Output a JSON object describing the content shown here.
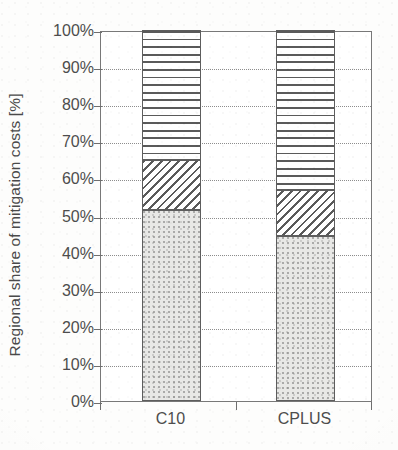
{
  "chart_data": {
    "type": "bar",
    "stacked": true,
    "title": "",
    "xlabel": "",
    "ylabel": "Regional share of mitigation costs [%]",
    "categories": [
      "C10",
      "CPLUS"
    ],
    "ylim": [
      0,
      100
    ],
    "yticks": [
      "0%",
      "10%",
      "20%",
      "30%",
      "40%",
      "50%",
      "60%",
      "70%",
      "80%",
      "90%",
      "100%"
    ],
    "ytick_values": [
      0,
      10,
      20,
      30,
      40,
      50,
      60,
      70,
      80,
      90,
      100
    ],
    "grid": "horizontal-dotted",
    "legend": "none",
    "series": [
      {
        "name": "stipple-segment",
        "pattern": "stipple",
        "values": [
          51.5,
          44.5
        ]
      },
      {
        "name": "diagonal-hatch-segment",
        "pattern": "diagonal-hatch",
        "values": [
          13.5,
          12.5
        ]
      },
      {
        "name": "horizontal-line-segment",
        "pattern": "horizontal-lines",
        "values": [
          35.0,
          43.0
        ]
      }
    ],
    "cumulative_tops": [
      {
        "category": "C10",
        "stipple_top": 51.5,
        "hatch_top": 65.0,
        "horiz_top": 100.0
      },
      {
        "category": "CPLUS",
        "stipple_top": 44.5,
        "hatch_top": 57.0,
        "horiz_top": 100.0
      }
    ],
    "colors": {
      "axis": "#6e6e6e",
      "frame": "#787878",
      "gridline": "#8d8d8d",
      "text": "#4d4d4d",
      "pattern_stroke": "#5a5a5a",
      "stipple_fill": "#e8e8e6",
      "background": "#ffffff"
    }
  },
  "axis": {
    "y_title": "Regional share of mitigation costs [%]",
    "y_ticks": [
      {
        "label": "100%",
        "value": 100
      },
      {
        "label": "90%",
        "value": 90
      },
      {
        "label": "80%",
        "value": 80
      },
      {
        "label": "70%",
        "value": 70
      },
      {
        "label": "60%",
        "value": 60
      },
      {
        "label": "50%",
        "value": 50
      },
      {
        "label": "40%",
        "value": 40
      },
      {
        "label": "30%",
        "value": 30
      },
      {
        "label": "20%",
        "value": 20
      },
      {
        "label": "10%",
        "value": 10
      },
      {
        "label": "0%",
        "value": 0
      }
    ],
    "x_ticks": [
      {
        "label": "C10"
      },
      {
        "label": "CPLUS"
      }
    ]
  }
}
